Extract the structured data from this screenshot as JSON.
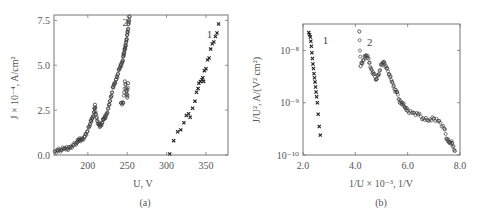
{
  "figure": {
    "panels": [
      {
        "caption": "(a)"
      },
      {
        "caption": "(b)"
      }
    ]
  },
  "chart_data": [
    {
      "type": "scatter",
      "panel": "(a)",
      "title": "",
      "xlabel": "U, V",
      "ylabel": "J × 10⁻⁴, A/cm²",
      "xlim": [
        157,
        378
      ],
      "ylim": [
        0,
        7.8
      ],
      "xticks": [
        200,
        250,
        300,
        350
      ],
      "xtick_labels": [
        "200",
        "250",
        "300",
        "350"
      ],
      "yticks": [
        0,
        2.5,
        5.0,
        7.5
      ],
      "ytick_labels": [
        "0.0",
        "2.5",
        "5.0",
        "7.5"
      ],
      "grid": false,
      "series": [
        {
          "name": "1",
          "marker": "x",
          "x": [
            304,
            309,
            314,
            318,
            322,
            325,
            328,
            330,
            333,
            336,
            338,
            340,
            341,
            343,
            345,
            346,
            347,
            348,
            350,
            352,
            354,
            356,
            358,
            360,
            362,
            364,
            366
          ],
          "y": [
            0.05,
            0.8,
            1.3,
            1.4,
            1.8,
            2.2,
            2.3,
            2.1,
            2.6,
            3.0,
            3.5,
            3.7,
            4.0,
            4.1,
            4.2,
            4.3,
            4.1,
            4.7,
            4.8,
            5.3,
            5.4,
            5.9,
            6.2,
            6.3,
            6.6,
            6.8,
            7.3
          ]
        },
        {
          "name": "2",
          "marker": "o",
          "x": [
            158,
            162,
            166,
            170,
            174,
            178,
            182,
            186,
            188,
            190,
            193,
            196,
            199,
            202,
            204,
            206,
            208,
            209,
            210,
            212,
            214,
            216,
            218,
            220,
            222,
            224,
            226,
            228,
            230,
            232,
            234,
            236,
            238,
            240,
            242,
            244,
            245,
            246,
            247,
            248,
            249,
            250,
            251,
            252,
            253
          ],
          "y": [
            0.2,
            0.25,
            0.3,
            0.35,
            0.35,
            0.45,
            0.55,
            0.7,
            0.8,
            0.85,
            0.9,
            1.0,
            1.3,
            1.6,
            1.9,
            2.1,
            2.4,
            2.8,
            2.3,
            1.9,
            1.7,
            1.6,
            1.8,
            2.0,
            2.1,
            2.3,
            2.6,
            3.0,
            3.3,
            3.8,
            4.0,
            4.2,
            4.5,
            4.8,
            5.0,
            5.2,
            5.5,
            5.7,
            5.9,
            6.1,
            6.4,
            6.7,
            7.0,
            7.4,
            7.7
          ]
        },
        {
          "name": "2-outliers",
          "marker": "o",
          "x": [
            242,
            245,
            247,
            249,
            250,
            251
          ],
          "y": [
            2.9,
            2.9,
            4.1,
            3.6,
            3.2,
            4.0
          ]
        }
      ],
      "annotations": [
        {
          "text": "2",
          "x": 244,
          "y": 7.2
        },
        {
          "text": "1",
          "x": 351,
          "y": 6.5
        }
      ]
    },
    {
      "type": "scatter",
      "panel": "(b)",
      "title": "",
      "xlabel": "1/U × 10⁻³, 1/V",
      "ylabel": "J/U², A/(V² cm²)",
      "yscale": "log",
      "xlim": [
        2.0,
        8.0
      ],
      "ylim": [
        1e-10,
        3.2e-08
      ],
      "xticks": [
        2.0,
        4.0,
        6.0,
        8.0
      ],
      "xtick_labels": [
        "2.0",
        "4.0",
        "6.0",
        "8.0"
      ],
      "yticks": [
        1e-10,
        1e-09,
        1e-08
      ],
      "ytick_labels": [
        "10⁻¹⁰",
        "10⁻⁹",
        "10⁻⁸"
      ],
      "grid": false,
      "series": [
        {
          "name": "1",
          "marker": "x",
          "x": [
            2.22,
            2.25,
            2.28,
            2.3,
            2.32,
            2.34,
            2.36,
            2.38,
            2.4,
            2.42,
            2.44,
            2.46,
            2.48,
            2.5,
            2.52,
            2.55,
            2.58,
            2.62,
            2.66
          ],
          "y": [
            2.2e-08,
            2e-08,
            1.8e-08,
            1.5e-08,
            1.2e-08,
            9e-09,
            7e-09,
            5.5e-09,
            4.5e-09,
            3.6e-09,
            3e-09,
            2.5e-09,
            2e-09,
            1.6e-09,
            1.3e-09,
            1e-09,
            6e-10,
            3.5e-10,
            2.4e-10
          ]
        },
        {
          "name": "2",
          "marker": "o",
          "x": [
            4.15,
            4.2,
            4.3,
            4.4,
            4.5,
            4.6,
            4.7,
            4.8,
            4.9,
            5.0,
            5.1,
            5.2,
            5.3,
            5.4,
            5.5,
            5.6,
            5.7,
            5.8,
            5.9,
            6.0,
            6.2,
            6.4,
            6.6,
            6.8,
            7.0,
            7.2,
            7.4,
            7.5,
            7.6,
            7.7,
            7.8
          ],
          "y": [
            2.3e-08,
            5e-09,
            6.5e-09,
            8e-09,
            7e-09,
            4.5e-09,
            3.5e-09,
            2.8e-09,
            3.5e-09,
            5.5e-09,
            6e-09,
            4.5e-09,
            3.5e-09,
            2.5e-09,
            1.8e-09,
            1.6e-09,
            1e-09,
            1e-09,
            8e-10,
            7e-10,
            6.5e-10,
            6e-10,
            5e-10,
            4.5e-10,
            5e-10,
            4.5e-10,
            3.2e-10,
            2e-10,
            1.7e-10,
            1.7e-10,
            1.2e-10
          ]
        }
      ],
      "annotations": [
        {
          "text": "1",
          "x": 2.75,
          "y": 1.3e-08
        },
        {
          "text": "2",
          "x": 4.45,
          "y": 1.2e-08
        }
      ]
    }
  ]
}
